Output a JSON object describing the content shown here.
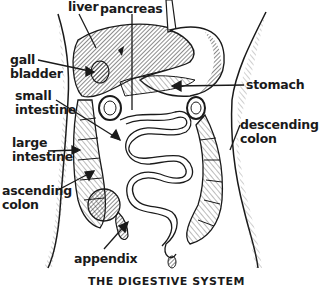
{
  "diagram": {
    "caption": "THE DIGESTIVE SYSTEM",
    "labels": {
      "liver": "liver",
      "pancreas": "pancreas",
      "gall_bladder_1": "gall",
      "gall_bladder_2": "bladder",
      "small_intestine_1": "small",
      "small_intestine_2": "intestine",
      "large_intestine_1": "large",
      "large_intestine_2": "intestine",
      "ascending_colon_1": "ascending",
      "ascending_colon_2": "colon",
      "appendix": "appendix",
      "stomach": "stomach",
      "descending_colon_1": "descending",
      "descending_colon_2": "colon"
    },
    "colors": {
      "ink": "#1a1a1a",
      "background": "#ffffff",
      "shade": "#8a8a8a"
    }
  }
}
